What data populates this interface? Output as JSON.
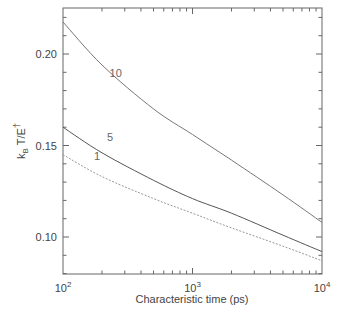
{
  "chart_data": {
    "type": "line",
    "title": "",
    "xlabel": "Characteristic time (ps)",
    "ylabel": "k_B T/E†",
    "xscale": "log",
    "xlim": [
      100,
      10000
    ],
    "ylim": [
      0.08,
      0.225
    ],
    "xticks": [
      {
        "value": 100,
        "base": "10",
        "exp": "2"
      },
      {
        "value": 1000,
        "base": "10",
        "exp": "3"
      },
      {
        "value": 10000,
        "base": "10",
        "exp": "4"
      }
    ],
    "yticks": [
      {
        "value": 0.1,
        "label": "0.10"
      },
      {
        "value": 0.15,
        "label": "0.15"
      },
      {
        "value": 0.2,
        "label": "0.20"
      }
    ],
    "grid": false,
    "legend": "none (inline curve labels)",
    "x": [
      100,
      200,
      500,
      1000,
      2000,
      5000,
      10000
    ],
    "series": [
      {
        "name": "10",
        "color": "#777777",
        "dash": "",
        "label_pos": [
          0.18,
          0.1895
        ],
        "values": [
          0.2175,
          0.194,
          0.17,
          0.156,
          0.142,
          0.123,
          0.108
        ]
      },
      {
        "name": "5",
        "color": "#555555",
        "dash": "",
        "label_pos": [
          0.17,
          0.1545
        ],
        "values": [
          0.16,
          0.146,
          0.131,
          0.121,
          0.113,
          0.101,
          0.092
        ]
      },
      {
        "name": "1",
        "color": "#999999",
        "dash": "2,1.5",
        "label_pos": [
          0.12,
          0.1445
        ],
        "values": [
          0.145,
          0.133,
          0.121,
          0.113,
          0.105,
          0.095,
          0.087
        ]
      }
    ]
  }
}
